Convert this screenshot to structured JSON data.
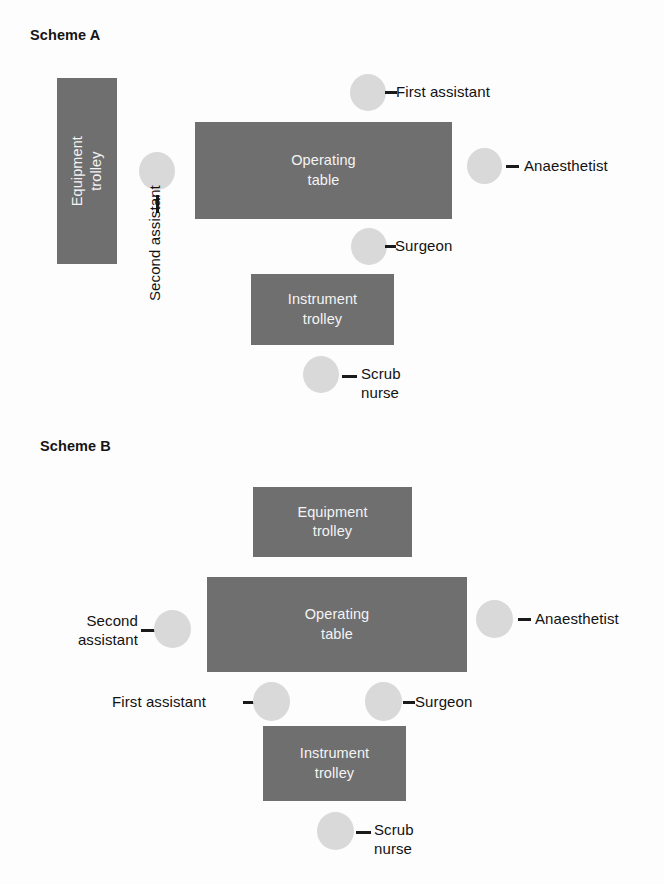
{
  "figure": {
    "kind": "operating-theatre-layout-diagram",
    "background_color": "#fdfdfd",
    "box_fill_color": "#6f6f6f",
    "box_text_color": "#f4f4f4",
    "person_fill_color": "#d9d9d9",
    "leader_color": "#1a1a1a",
    "label_text_color": "#121212"
  },
  "scheme_a": {
    "title": "Scheme A",
    "boxes": {
      "equipment_trolley": "Equipment\ntrolley",
      "operating_table": "Operating\ntable",
      "instrument_trolley": "Instrument\ntrolley"
    },
    "people": {
      "first_assistant": "First assistant",
      "anaesthetist": "Anaesthetist",
      "second_assistant": "Second\nassistant",
      "surgeon": "Surgeon",
      "scrub_nurse": "Scrub\nnurse"
    }
  },
  "scheme_b": {
    "title": "Scheme B",
    "boxes": {
      "equipment_trolley": "Equipment\ntrolley",
      "operating_table": "Operating\ntable",
      "instrument_trolley": "Instrument\ntrolley"
    },
    "people": {
      "second_assistant": "Second\nassistant",
      "anaesthetist": "Anaesthetist",
      "first_assistant": "First assistant",
      "surgeon": "Surgeon",
      "scrub_nurse": "Scrub\nnurse"
    }
  }
}
